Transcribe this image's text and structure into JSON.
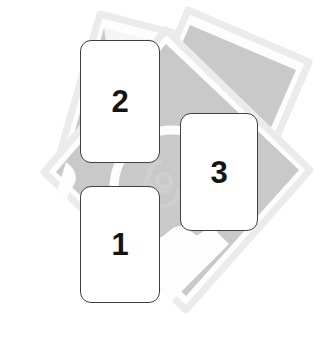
{
  "illustration": {
    "title": "Numbered cards over photo stack",
    "canvas": {
      "width": 320,
      "height": 338,
      "background": "#ffffff"
    },
    "colors": {
      "card_fill": "#ffffff",
      "card_border": "#3f3f3f",
      "number_color": "#141414",
      "photo_border": "#ebebeb",
      "photo_fill": "#c9c9c9",
      "photo_white": "#fdfdfd"
    },
    "cards": [
      {
        "id": "card-1",
        "label": "1",
        "order": 1
      },
      {
        "id": "card-2",
        "label": "2",
        "order": 2
      },
      {
        "id": "card-3",
        "label": "3",
        "order": 3
      }
    ],
    "background_photos": [
      {
        "id": "photo-back",
        "name": "photo-sheet-back"
      },
      {
        "id": "photo-middle",
        "name": "photo-sheet-middle"
      },
      {
        "id": "photo-front",
        "name": "photo-sheet-front"
      }
    ]
  }
}
